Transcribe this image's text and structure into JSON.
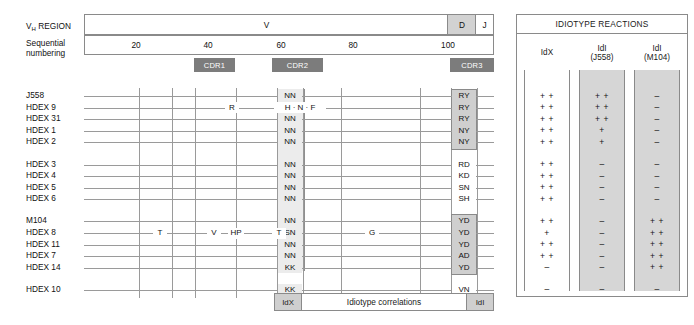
{
  "header": {
    "vh_region_label": "V",
    "vh_region_label_sub": "H",
    "vh_region_label_tail": " REGION",
    "sequential_label_line1": "Sequential",
    "sequential_label_line2": "numbering",
    "segments": [
      {
        "name": "V",
        "label": "V"
      },
      {
        "name": "D",
        "label": "D"
      },
      {
        "name": "J",
        "label": "J"
      }
    ],
    "ticks": [
      "20",
      "40",
      "60",
      "80",
      "100"
    ],
    "cdr_boxes": [
      {
        "label": "CDR1"
      },
      {
        "label": "CDR2"
      },
      {
        "label": "CDR3"
      }
    ]
  },
  "correlation_bar": {
    "left_label": "IdX",
    "center_label": "Idiotype correlations",
    "right_label": "IdI"
  },
  "idiotype_panel": {
    "title": "IDIOTYPE REACTIONS",
    "columns": [
      {
        "name": "idx",
        "line1": "IdX",
        "line2": "",
        "shaded": false
      },
      {
        "name": "idi-j558",
        "line1": "IdI",
        "line2": "(J558)",
        "shaded": true
      },
      {
        "name": "idi-m104",
        "line1": "IdI",
        "line2": "(M104)",
        "shaded": true
      }
    ]
  },
  "groups": [
    {
      "name": "group-1",
      "rows": [
        {
          "label": "J558",
          "cdr2": "NN",
          "cdr3": "RY",
          "cdr3_boxed": true,
          "markers": [],
          "idx": "+ +",
          "idi_j558": "+ +",
          "idi_m104": "–"
        },
        {
          "label": "HDEX 9",
          "cdr2": "NN",
          "cdr3": "RY",
          "cdr3_boxed": true,
          "markers": [
            {
              "text": "R",
              "x": 232
            },
            {
              "text": "H · N · F",
              "x": 300
            }
          ],
          "idx": "+ +",
          "idi_j558": "+ +",
          "idi_m104": "–"
        },
        {
          "label": "HDEX 31",
          "cdr2": "NN",
          "cdr3": "RY",
          "cdr3_boxed": true,
          "markers": [],
          "idx": "+ +",
          "idi_j558": "+ +",
          "idi_m104": "–"
        },
        {
          "label": "HDEX 1",
          "cdr2": "NN",
          "cdr3": "NY",
          "cdr3_boxed": true,
          "markers": [],
          "idx": "+ +",
          "idi_j558": "+",
          "idi_m104": "–"
        },
        {
          "label": "HDEX 2",
          "cdr2": "NN",
          "cdr3": "NY",
          "cdr3_boxed": true,
          "markers": [],
          "idx": "+ +",
          "idi_j558": "+",
          "idi_m104": "–"
        }
      ]
    },
    {
      "name": "group-2",
      "rows": [
        {
          "label": "HDEX 3",
          "cdr2": "NN",
          "cdr3": "RD",
          "cdr3_boxed": false,
          "markers": [],
          "idx": "+ +",
          "idi_j558": "–",
          "idi_m104": "–"
        },
        {
          "label": "HDEX 4",
          "cdr2": "NN",
          "cdr3": "KD",
          "cdr3_boxed": false,
          "markers": [],
          "idx": "+ +",
          "idi_j558": "–",
          "idi_m104": "–"
        },
        {
          "label": "HDEX 5",
          "cdr2": "NN",
          "cdr3": "SN",
          "cdr3_boxed": false,
          "markers": [],
          "idx": "+ +",
          "idi_j558": "–",
          "idi_m104": "–"
        },
        {
          "label": "HDEX 6",
          "cdr2": "NN",
          "cdr3": "SH",
          "cdr3_boxed": false,
          "markers": [],
          "idx": "+ +",
          "idi_j558": "–",
          "idi_m104": "–"
        }
      ]
    },
    {
      "name": "group-3",
      "rows": [
        {
          "label": "M104",
          "cdr2": "NN",
          "cdr3": "YD",
          "cdr3_boxed": true,
          "markers": [],
          "idx": "+ +",
          "idi_j558": "–",
          "idi_m104": "+ +"
        },
        {
          "label": "HDEX 8",
          "cdr2": "SN",
          "cdr3": "YD",
          "cdr3_boxed": true,
          "markers": [
            {
              "text": "T",
              "x": 160
            },
            {
              "text": "V",
              "x": 214
            },
            {
              "text": "HP",
              "x": 236
            },
            {
              "text": "T",
              "x": 279
            },
            {
              "text": "G",
              "x": 372
            }
          ],
          "idx": "+",
          "idi_j558": "–",
          "idi_m104": "+ +"
        },
        {
          "label": "HDEX 11",
          "cdr2": "NN",
          "cdr3": "YD",
          "cdr3_boxed": true,
          "markers": [],
          "idx": "+ +",
          "idi_j558": "–",
          "idi_m104": "+ +"
        },
        {
          "label": "HDEX 7",
          "cdr2": "NN",
          "cdr3": "AD",
          "cdr3_boxed": true,
          "markers": [],
          "idx": "+ +",
          "idi_j558": "–",
          "idi_m104": "+ +"
        },
        {
          "label": "HDEX 14",
          "cdr2": "KK",
          "cdr3": "YD",
          "cdr3_boxed": true,
          "markers": [],
          "idx": "–",
          "idi_j558": "–",
          "idi_m104": "+ +"
        }
      ]
    },
    {
      "name": "group-4",
      "rows": [
        {
          "label": "HDEX 10",
          "cdr2": "KK",
          "cdr3": "VN",
          "cdr3_boxed": false,
          "markers": [],
          "idx": "–",
          "idi_j558": "–",
          "idi_m104": "–"
        }
      ]
    }
  ]
}
